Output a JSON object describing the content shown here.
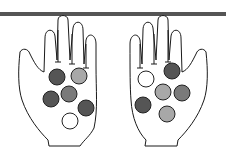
{
  "figure": {
    "bar_color": "#555555",
    "outline_color": "#1a1a1a",
    "colors": {
      "dark": "#555555",
      "medium": "#7a7a7a",
      "light": "#a8a8a8",
      "white": "#ffffff"
    },
    "hands": [
      {
        "name": "left-hand",
        "counters": [
          "dark",
          "light",
          "medium",
          "dark",
          "dark",
          "white"
        ],
        "counts": {
          "dark": 3,
          "medium": 1,
          "light": 1,
          "white": 1
        }
      },
      {
        "name": "right-hand",
        "counters": [
          "white",
          "dark",
          "light",
          "medium",
          "dark",
          "light"
        ],
        "counts": {
          "dark": 2,
          "medium": 1,
          "light": 2,
          "white": 1
        }
      }
    ]
  }
}
